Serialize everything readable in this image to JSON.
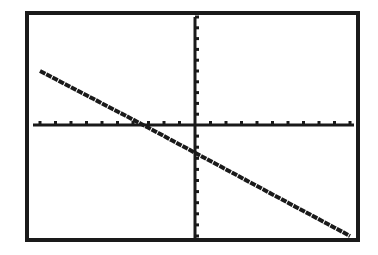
{
  "chart_data": {
    "type": "line",
    "title": "",
    "xlabel": "",
    "ylabel": "",
    "xlim": [
      -10,
      10
    ],
    "ylim": [
      -10,
      10
    ],
    "xscale": 1,
    "yscale": 1,
    "grid": false,
    "legend": null,
    "series": [
      {
        "name": "y = -0.75x - 2.5",
        "slope": -0.75,
        "intercept": -2.5,
        "x": [
          -10,
          -5,
          0,
          5,
          10
        ],
        "values": [
          5,
          1.25,
          -2.5,
          -6.25,
          -10
        ]
      }
    ],
    "annotations": [],
    "colors": {
      "ink": "#1a1a1a",
      "background": "#ffffff"
    }
  },
  "layout": {
    "frame": {
      "left": 27,
      "top": 13,
      "right": 358,
      "bottom": 240
    },
    "axis_origin_px": {
      "x": 195,
      "y": 125
    }
  }
}
